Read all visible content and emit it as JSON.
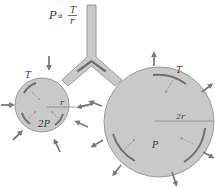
{
  "figure": {
    "formula": {
      "lhs": "P",
      "relation": "∝",
      "numerator": "T",
      "denominator": "r"
    },
    "small_alveolus": {
      "tension_label": "T",
      "radius_label": "r",
      "pressure_label": "2P"
    },
    "large_alveolus": {
      "tension_label": "T",
      "radius_label": "2r",
      "pressure_label": "P"
    },
    "colors": {
      "fill": "#c9c9c9",
      "outline": "#9a9a9a",
      "tension_arc": "#6e6e6e",
      "arrow": "#7a7a7a",
      "text": "#333333"
    }
  }
}
